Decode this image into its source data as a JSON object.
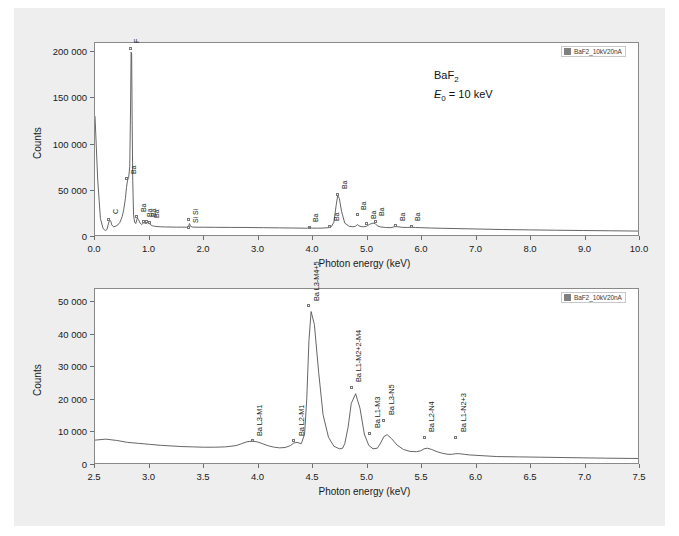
{
  "figure": {
    "background_color": "#eeeeee",
    "plot_background_color": "#ffffff",
    "trace_color": "#555555",
    "legend_swatch_color": "#808080"
  },
  "annotations": {
    "sample": "BaF",
    "sample_sub": "2",
    "beam_energy_symbol": "E",
    "beam_energy_sub": "0",
    "beam_energy_value": "= 10 keV"
  },
  "legend": {
    "label": "BaF2_10kV20nA"
  },
  "chart_data": [
    {
      "type": "line",
      "id": "top-spectrum",
      "title": "",
      "xlabel": "Photon energy (keV)",
      "ylabel": "Counts",
      "xlim": [
        0.0,
        10.0
      ],
      "ylim": [
        0,
        210000
      ],
      "xticks": [
        "0.0",
        "1.0",
        "2.0",
        "3.0",
        "4.0",
        "5.0",
        "6.0",
        "7.0",
        "8.0",
        "9.0",
        "10.0"
      ],
      "xtick_values": [
        0.0,
        1.0,
        2.0,
        3.0,
        4.0,
        5.0,
        6.0,
        7.0,
        8.0,
        9.0,
        10.0
      ],
      "yticks": [
        "0",
        "50 000",
        "100 000",
        "150 000",
        "200 000"
      ],
      "ytick_values": [
        0,
        50000,
        100000,
        150000,
        200000
      ],
      "grid": false,
      "legend_position": "top-right",
      "series": [
        {
          "name": "BaF2_10kV20nA",
          "x": [
            0.0,
            0.05,
            0.1,
            0.15,
            0.18,
            0.2,
            0.22,
            0.25,
            0.27,
            0.29,
            0.31,
            0.34,
            0.38,
            0.42,
            0.46,
            0.5,
            0.53,
            0.56,
            0.58,
            0.6,
            0.62,
            0.64,
            0.655,
            0.665,
            0.675,
            0.685,
            0.695,
            0.71,
            0.73,
            0.75,
            0.78,
            0.8,
            0.83,
            0.86,
            0.9,
            0.94,
            0.97,
            1.0,
            1.03,
            1.06,
            1.1,
            1.2,
            1.3,
            1.4,
            1.5,
            1.6,
            1.68,
            1.72,
            1.74,
            1.76,
            1.8,
            1.9,
            2.0,
            2.2,
            2.5,
            2.8,
            3.1,
            3.4,
            3.7,
            3.9,
            3.95,
            4.0,
            4.1,
            4.2,
            4.3,
            4.35,
            4.4,
            4.44,
            4.47,
            4.5,
            4.54,
            4.6,
            4.68,
            4.75,
            4.8,
            4.83,
            4.86,
            4.9,
            4.95,
            5.0,
            5.05,
            5.12,
            5.16,
            5.2,
            5.26,
            5.35,
            5.45,
            5.52,
            5.58,
            5.65,
            5.75,
            5.82,
            5.9,
            6.0,
            6.2,
            6.5,
            7.0,
            7.5,
            8.0,
            8.5,
            9.0,
            9.5,
            10.0
          ],
          "y": [
            130000,
            60000,
            18000,
            7000,
            5500,
            5000,
            6000,
            13000,
            16500,
            15000,
            11000,
            9000,
            9500,
            11000,
            14000,
            20000,
            28000,
            40000,
            52000,
            60000,
            63000,
            75000,
            140000,
            200000,
            198000,
            120000,
            60000,
            22000,
            14000,
            12500,
            18500,
            17000,
            13000,
            11500,
            13500,
            12500,
            13500,
            12500,
            11000,
            10000,
            9500,
            9000,
            8800,
            8700,
            8600,
            8600,
            8500,
            9000,
            12500,
            9500,
            8600,
            8500,
            8500,
            8400,
            8300,
            8200,
            8000,
            7800,
            7600,
            7400,
            8200,
            7500,
            7500,
            7600,
            8000,
            9000,
            14000,
            32000,
            43000,
            40000,
            26000,
            13000,
            9500,
            9000,
            9500,
            11500,
            10000,
            9200,
            9000,
            9500,
            11500,
            13000,
            12500,
            10000,
            8800,
            8200,
            8000,
            9200,
            9000,
            8400,
            8200,
            8500,
            8200,
            8000,
            7600,
            7200,
            6600,
            6000,
            5600,
            5200,
            4900,
            4600,
            4300
          ]
        }
      ],
      "peak_labels": [
        {
          "text": "C",
          "x": 0.27,
          "y": 18000,
          "size": "sm"
        },
        {
          "text": "F",
          "x": 0.665,
          "y": 203000,
          "size": "sm"
        },
        {
          "text": "Ba",
          "x": 0.6,
          "y": 62000,
          "size": "sm"
        },
        {
          "text": "Ba",
          "x": 0.78,
          "y": 21000,
          "size": "sm"
        },
        {
          "text": "Ba",
          "x": 0.9,
          "y": 15500,
          "size": "sm"
        },
        {
          "text": "Ba",
          "x": 0.965,
          "y": 15500,
          "size": "sm"
        },
        {
          "text": "Ba",
          "x": 1.02,
          "y": 14500,
          "size": "sm"
        },
        {
          "text": "Si",
          "x": 1.74,
          "y": 17500,
          "size": "sm"
        },
        {
          "text": "Si",
          "x": 1.74,
          "y": 9000,
          "size": "sm"
        },
        {
          "text": "Ba",
          "x": 3.95,
          "y": 9500,
          "size": "sm"
        },
        {
          "text": "Ba",
          "x": 4.33,
          "y": 10500,
          "size": "sm"
        },
        {
          "text": "Ba",
          "x": 4.47,
          "y": 45000,
          "size": "sm"
        },
        {
          "text": "Ba",
          "x": 4.83,
          "y": 23000,
          "size": "sm"
        },
        {
          "text": "Ba",
          "x": 5.0,
          "y": 13000,
          "size": "sm"
        },
        {
          "text": "Ba",
          "x": 5.16,
          "y": 16000,
          "size": "sm"
        },
        {
          "text": "Ba",
          "x": 5.53,
          "y": 11000,
          "size": "sm"
        },
        {
          "text": "Ba",
          "x": 5.82,
          "y": 10500,
          "size": "sm"
        }
      ]
    },
    {
      "type": "line",
      "id": "bottom-spectrum",
      "title": "",
      "xlabel": "Photon energy (keV)",
      "ylabel": "Counts",
      "xlim": [
        2.5,
        7.5
      ],
      "ylim": [
        0,
        54000
      ],
      "xticks": [
        "2.5",
        "3.0",
        "3.5",
        "4.0",
        "4.5",
        "5.0",
        "5.5",
        "6.0",
        "6.5",
        "7.0",
        "7.5"
      ],
      "xtick_values": [
        2.5,
        3.0,
        3.5,
        4.0,
        4.5,
        5.0,
        5.5,
        6.0,
        6.5,
        7.0,
        7.5
      ],
      "yticks": [
        "0",
        "10 000",
        "20 000",
        "30 000",
        "40 000",
        "50 000"
      ],
      "ytick_values": [
        0,
        10000,
        20000,
        30000,
        40000,
        50000
      ],
      "grid": false,
      "legend_position": "top-right",
      "series": [
        {
          "name": "BaF2_10kV20nA",
          "x": [
            2.5,
            2.6,
            2.7,
            2.8,
            2.9,
            3.0,
            3.1,
            3.2,
            3.3,
            3.4,
            3.5,
            3.6,
            3.7,
            3.8,
            3.85,
            3.9,
            3.95,
            4.0,
            4.05,
            4.1,
            4.15,
            4.2,
            4.25,
            4.3,
            4.33,
            4.36,
            4.4,
            4.43,
            4.45,
            4.47,
            4.49,
            4.52,
            4.56,
            4.6,
            4.65,
            4.7,
            4.75,
            4.78,
            4.8,
            4.83,
            4.86,
            4.9,
            4.94,
            4.98,
            5.02,
            5.06,
            5.1,
            5.13,
            5.16,
            5.19,
            5.23,
            5.28,
            5.34,
            5.4,
            5.46,
            5.5,
            5.53,
            5.56,
            5.6,
            5.65,
            5.7,
            5.75,
            5.79,
            5.82,
            5.85,
            5.9,
            5.95,
            6.0,
            6.1,
            6.2,
            6.4,
            6.6,
            6.8,
            7.0,
            7.2,
            7.5
          ],
          "y": [
            7100,
            7400,
            7000,
            6400,
            6100,
            5800,
            5500,
            5300,
            5100,
            5000,
            4900,
            4900,
            5000,
            5400,
            6000,
            6600,
            6800,
            6500,
            5900,
            5300,
            4900,
            4700,
            4800,
            5400,
            6200,
            6400,
            6000,
            9000,
            20000,
            38000,
            47000,
            43000,
            28000,
            15000,
            8000,
            5200,
            4400,
            4600,
            6000,
            11000,
            18500,
            21500,
            17000,
            9000,
            5500,
            4400,
            4600,
            6200,
            8200,
            8800,
            7600,
            5600,
            4200,
            3600,
            3500,
            3800,
            4400,
            4600,
            4200,
            3500,
            3000,
            2700,
            2700,
            2900,
            2900,
            2700,
            2500,
            2400,
            2200,
            2000,
            1900,
            1800,
            1700,
            1600,
            1500,
            1400
          ]
        }
      ],
      "peak_labels": [
        {
          "text": "Ba L3-M1",
          "x": 3.95,
          "y": 7200,
          "size": "lg"
        },
        {
          "text": "Ba L2-M1",
          "x": 4.33,
          "y": 7200,
          "size": "lg"
        },
        {
          "text": "Ba L3-M4+5",
          "x": 4.47,
          "y": 48500,
          "size": "lg"
        },
        {
          "text": "Ba L1-M2+2-M4",
          "x": 4.86,
          "y": 23500,
          "size": "lg"
        },
        {
          "text": "Ba L1-M3",
          "x": 5.03,
          "y": 9500,
          "size": "lg"
        },
        {
          "text": "Ba L3-N5",
          "x": 5.16,
          "y": 13500,
          "size": "lg"
        },
        {
          "text": "Ba L2-N4",
          "x": 5.53,
          "y": 8200,
          "size": "lg"
        },
        {
          "text": "Ba L1-N2+3",
          "x": 5.82,
          "y": 8200,
          "size": "lg"
        }
      ]
    }
  ]
}
